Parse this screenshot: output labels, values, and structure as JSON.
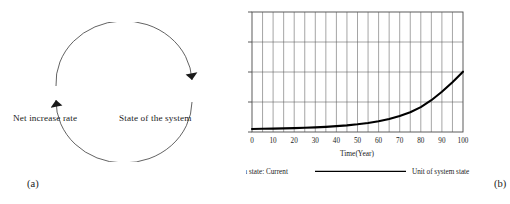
{
  "figure": {
    "panel_a": {
      "caption": "(a)",
      "labels": {
        "left": "Net increase rate",
        "right": "State of the system"
      },
      "icons": {
        "top_arrow": "arrowhead-clockwise-icon",
        "bottom_arrow": "arrowhead-counterclockwise-icon"
      }
    },
    "panel_b": {
      "caption": "(b)"
    }
  },
  "chart_data": {
    "type": "line",
    "title": "",
    "xlabel": "Time(Year)",
    "ylabel": "",
    "xlim": [
      0,
      100
    ],
    "ylim": [
      0,
      4000000
    ],
    "grid": true,
    "x_ticks": [
      0,
      10,
      20,
      30,
      40,
      50,
      60,
      70,
      80,
      90,
      100
    ],
    "x_tick_labels": [
      "0",
      "10",
      "20",
      "30",
      "40",
      "50",
      "60",
      "70",
      "80",
      "90",
      "100"
    ],
    "x_minor_step": 5,
    "y_ticks": [
      0,
      1000000,
      2000000,
      3000000,
      4000000
    ],
    "y_tick_labels": [
      "0",
      "1M",
      "4M",
      "3M",
      "4M"
    ],
    "legend_position": "below",
    "legend": [
      {
        "label": "System state: Current",
        "color": "#000000",
        "swatch": "solid-line-swatch"
      },
      {
        "label": "Unit of system state",
        "color": "#000000",
        "swatch": "solid-line-swatch"
      }
    ],
    "series": [
      {
        "name": "System state: Current",
        "color": "#000000",
        "x": [
          0,
          5,
          10,
          15,
          20,
          25,
          30,
          35,
          40,
          45,
          50,
          55,
          60,
          65,
          70,
          75,
          80,
          85,
          90,
          95,
          100
        ],
        "values": [
          100000,
          106000,
          113000,
          120000,
          128000,
          140000,
          155000,
          172000,
          195000,
          222000,
          258000,
          302000,
          360000,
          435000,
          533000,
          660000,
          830000,
          1060000,
          1340000,
          1660000,
          2010000
        ]
      }
    ]
  }
}
